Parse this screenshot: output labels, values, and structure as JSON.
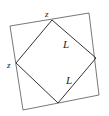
{
  "diagram": {
    "type": "geometry",
    "labels": {
      "top_vertex": "z",
      "left_vertex": "z",
      "upper_right_side": "L",
      "lower_right_side": "L"
    },
    "outer_square": [
      [
        10,
        26
      ],
      [
        89,
        13
      ],
      [
        99,
        95
      ],
      [
        23,
        110
      ]
    ],
    "inner_square": [
      [
        52,
        20
      ],
      [
        96,
        58
      ],
      [
        58,
        103
      ],
      [
        16,
        63
      ]
    ],
    "colors": {
      "stroke": "#333333",
      "background": "#ffffff"
    }
  }
}
